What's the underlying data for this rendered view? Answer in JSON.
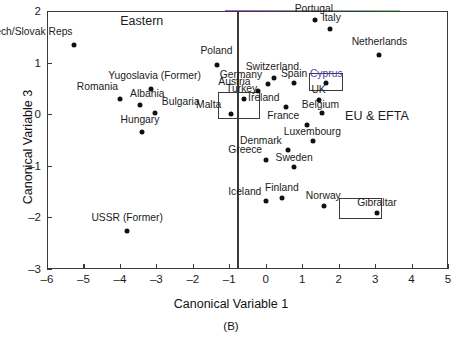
{
  "figure": {
    "caption": "(B)",
    "axes": {
      "xlabel": "Canonical Variable 1",
      "ylabel": "Canonical Variable 3",
      "xticks": [
        "-6",
        "-5",
        "-4",
        "-3",
        "-2",
        "-1",
        "0",
        "1",
        "2",
        "3",
        "4",
        "5"
      ],
      "yticks": [
        "2",
        "1",
        "0",
        "-1",
        "-2",
        "-3"
      ]
    },
    "regions": [
      {
        "name": "eastern",
        "label": "Eastern",
        "x": -3.4,
        "y": 1.78
      },
      {
        "name": "eu-efta",
        "label": "EU & EFTA",
        "x": 3.05,
        "y": -0.05
      }
    ],
    "divider": {
      "x": -0.78
    },
    "highlight_boxes": [
      {
        "name": "malta-turkey-box",
        "x0": -1.3,
        "y0": 0.43,
        "x1": -0.17,
        "y1": -0.09
      },
      {
        "name": "cyprus-box",
        "x0": 1.18,
        "y0": 0.8,
        "x1": 2.12,
        "y1": 0.44
      },
      {
        "name": "gibraltar-box",
        "x0": 2.0,
        "y0": -1.62,
        "x1": 3.2,
        "y1": -2.04
      }
    ]
  },
  "chart_data": {
    "type": "scatter",
    "title": "",
    "xlabel": "Canonical Variable 1",
    "ylabel": "Canonical Variable 3",
    "xlim": [
      -6,
      5
    ],
    "ylim": [
      -3,
      2
    ],
    "xticks": [
      -6,
      -5,
      -4,
      -3,
      -2,
      -1,
      0,
      1,
      2,
      3,
      4,
      5
    ],
    "yticks": [
      -3,
      -2,
      -1,
      0,
      1,
      2
    ],
    "grid": false,
    "legend": null,
    "annotations": [
      "Eastern",
      "EU & EFTA",
      "(B)"
    ],
    "groups": [
      {
        "name": "Eastern",
        "points": [
          {
            "label": "Czech/Slovak Reps",
            "x": -5.25,
            "y": 1.35,
            "label_pos": "above-left",
            "lx": -5.3,
            "ly": 1.58
          },
          {
            "label": "Poland",
            "x": -1.35,
            "y": 0.96,
            "label_pos": "above",
            "lx": -1.35,
            "ly": 1.2
          },
          {
            "label": "Yugoslavia (Former)",
            "x": -3.15,
            "y": 0.48,
            "label_pos": "above",
            "lx": -3.05,
            "ly": 0.72
          },
          {
            "label": "Romania",
            "x": -4.0,
            "y": 0.3,
            "label_pos": "above-left",
            "lx": -4.05,
            "ly": 0.5
          },
          {
            "label": "Albania",
            "x": -3.45,
            "y": 0.17,
            "label_pos": "above",
            "lx": -3.25,
            "ly": 0.37
          },
          {
            "label": "Bulgaria",
            "x": -3.05,
            "y": 0.02,
            "label_pos": "right",
            "lx": -2.85,
            "ly": 0.22
          },
          {
            "label": "Hungary",
            "x": -3.4,
            "y": -0.35,
            "label_pos": "above",
            "lx": -3.45,
            "ly": -0.14
          },
          {
            "label": "USSR (Former)",
            "x": -3.8,
            "y": -2.27,
            "label_pos": "above",
            "lx": -3.8,
            "ly": -2.03
          }
        ]
      },
      {
        "name": "EU & EFTA",
        "points": [
          {
            "label": "Portugal",
            "x": 1.35,
            "y": 1.83,
            "label_pos": "above",
            "lx": 1.32,
            "ly": 2.02
          },
          {
            "label": "Italy",
            "x": 1.75,
            "y": 1.66,
            "label_pos": "above",
            "lx": 1.8,
            "ly": 1.85
          },
          {
            "label": "Netherlands",
            "x": 3.12,
            "y": 1.15,
            "label_pos": "above",
            "lx": 3.12,
            "ly": 1.38
          },
          {
            "label": "Switzerland",
            "x": 0.22,
            "y": 0.7,
            "label_pos": "above",
            "lx": 0.18,
            "ly": 0.9
          },
          {
            "label": "Germany",
            "x": 0.05,
            "y": 0.59,
            "label_pos": "left",
            "lx": -0.1,
            "ly": 0.75
          },
          {
            "label": "Spain",
            "x": 0.78,
            "y": 0.6,
            "label_pos": "above",
            "lx": 0.78,
            "ly": 0.76
          },
          {
            "label": "Cyprus",
            "x": 1.65,
            "y": 0.6,
            "label_pos": "above",
            "lx": 1.66,
            "ly": 0.76,
            "accent": true
          },
          {
            "label": "Austria",
            "x": -0.22,
            "y": 0.44,
            "label_pos": "left",
            "lx": -0.42,
            "ly": 0.6
          },
          {
            "label": "Turkey",
            "x": -0.6,
            "y": 0.3,
            "label_pos": "above",
            "lx": -0.66,
            "ly": 0.46
          },
          {
            "label": "UK",
            "x": 1.45,
            "y": 0.28,
            "label_pos": "above",
            "lx": 1.45,
            "ly": 0.45
          },
          {
            "label": "Ireland",
            "x": 0.55,
            "y": 0.13,
            "label_pos": "left",
            "lx": 0.38,
            "ly": 0.29
          },
          {
            "label": "Malta",
            "x": -0.95,
            "y": 0.0,
            "label_pos": "above-left",
            "lx": -1.22,
            "ly": 0.16
          },
          {
            "label": "Belgium",
            "x": 1.53,
            "y": 0.02,
            "label_pos": "above",
            "lx": 1.5,
            "ly": 0.16
          },
          {
            "label": "France",
            "x": 1.12,
            "y": -0.2,
            "label_pos": "left",
            "lx": 0.92,
            "ly": -0.05
          },
          {
            "label": "Luxembourg",
            "x": 1.3,
            "y": -0.52,
            "label_pos": "above",
            "lx": 1.28,
            "ly": -0.36
          },
          {
            "label": "Denmark",
            "x": 0.62,
            "y": -0.7,
            "label_pos": "left",
            "lx": 0.44,
            "ly": -0.54
          },
          {
            "label": "Greece",
            "x": 0.02,
            "y": -0.88,
            "label_pos": "above-left",
            "lx": -0.1,
            "ly": -0.71
          },
          {
            "label": "Sweden",
            "x": 0.78,
            "y": -1.02,
            "label_pos": "above",
            "lx": 0.78,
            "ly": -0.86
          },
          {
            "label": "Finland",
            "x": 0.45,
            "y": -1.62,
            "label_pos": "above",
            "lx": 0.44,
            "ly": -1.45
          },
          {
            "label": "Iceland",
            "x": 0.02,
            "y": -1.68,
            "label_pos": "left",
            "lx": -0.12,
            "ly": -1.53
          },
          {
            "label": "Norway",
            "x": 1.6,
            "y": -1.78,
            "label_pos": "above",
            "lx": 1.58,
            "ly": -1.6
          },
          {
            "label": "Gibraltar",
            "x": 3.05,
            "y": -1.92,
            "label_pos": "above",
            "lx": 3.05,
            "ly": -1.74
          }
        ]
      }
    ]
  }
}
